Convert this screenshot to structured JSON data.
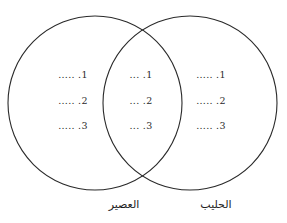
{
  "diagram": {
    "type": "venn-two-set",
    "stroke_color": "#2a2a2a",
    "fill_color": "#ffffff",
    "background_color": "#ffffff",
    "left_circle": {
      "cx": 95,
      "cy": 103,
      "r": 87
    },
    "right_circle": {
      "cx": 190,
      "cy": 103,
      "r": 87
    }
  },
  "left_region": {
    "label": "العصير",
    "entries": [
      {
        "number": "1.",
        "blank": "....."
      },
      {
        "number": "2.",
        "blank": "....."
      },
      {
        "number": "3.",
        "blank": "....."
      }
    ],
    "lines": [
      "1. .....",
      "2. .....",
      "3. ....."
    ]
  },
  "middle_region": {
    "label": "",
    "entries": [
      {
        "number": "1.",
        "blank": "..."
      },
      {
        "number": "2.",
        "blank": "..."
      },
      {
        "number": "3.",
        "blank": "..."
      }
    ],
    "lines": [
      "1. ...",
      "2. ...",
      "3. ..."
    ]
  },
  "right_region": {
    "label": "الحليب",
    "entries": [
      {
        "number": "1.",
        "blank": "....."
      },
      {
        "number": "2.",
        "blank": "....."
      },
      {
        "number": "3.",
        "blank": "....."
      }
    ],
    "lines": [
      "1. .....",
      "2. .....",
      "3. ....."
    ]
  }
}
